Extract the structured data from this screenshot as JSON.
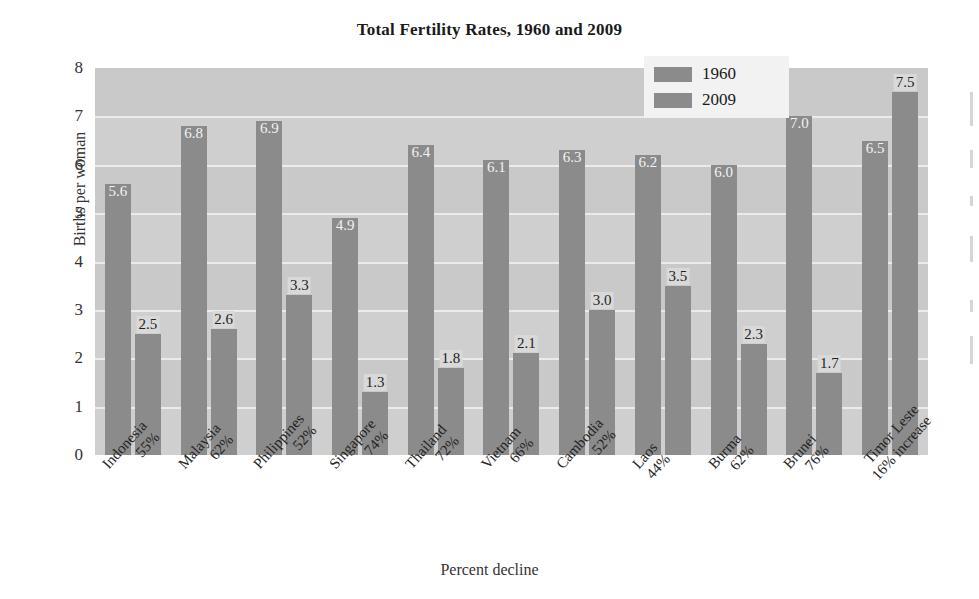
{
  "chart_data": {
    "type": "bar",
    "title": "Total Fertility Rates, 1960 and 2009",
    "xlabel": "Percent decline",
    "ylabel": "Births per woman",
    "ylim": [
      0,
      8
    ],
    "yticks": [
      "0",
      "1",
      "2",
      "3",
      "4",
      "5",
      "6",
      "7",
      "8"
    ],
    "grid": true,
    "legend_position": "top-right",
    "categories": [
      "Indonesia",
      "Malaysia",
      "Philippines",
      "Singapore",
      "Thailand",
      "Vietnam",
      "Cambodia",
      "Laos",
      "Burma",
      "Brunei",
      "Timor Leste"
    ],
    "category_sublabels": [
      "55%",
      "62%",
      "52%",
      "74%",
      "72%",
      "66%",
      "52%",
      "44%",
      "62%",
      "76%",
      "16% increase"
    ],
    "series": [
      {
        "name": "1960",
        "color": "#8b8b8b",
        "values": [
          5.6,
          6.8,
          6.9,
          4.9,
          6.4,
          6.1,
          6.3,
          6.2,
          6.0,
          7.0,
          6.5
        ],
        "labels": [
          "5.6",
          "6.8",
          "6.9",
          "4.9",
          "6.4",
          "6.1",
          "6.3",
          "6.2",
          "6.0",
          "7.0",
          "6.5"
        ]
      },
      {
        "name": "2009",
        "color": "#8b8b8b",
        "values": [
          2.5,
          2.6,
          3.3,
          1.3,
          1.8,
          2.1,
          3.0,
          3.5,
          2.3,
          1.7,
          7.5
        ],
        "labels": [
          "2.5",
          "2.6",
          "3.3",
          "1.3",
          "1.8",
          "2.1",
          "3.0",
          "3.5",
          "2.3",
          "1.7",
          "7.5"
        ]
      }
    ]
  },
  "colors": {
    "plot_background": "#cfcfcf",
    "bar": "#8b8b8b",
    "gridline": "#eceaea",
    "legend_background": "#f2f2f2",
    "text": "#242424"
  }
}
